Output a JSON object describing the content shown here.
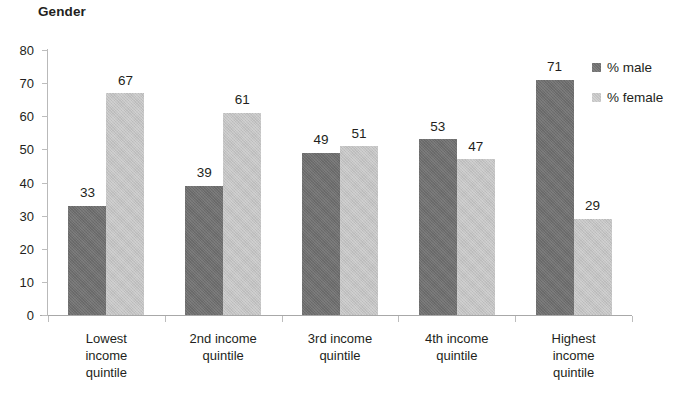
{
  "chart_data": {
    "type": "bar",
    "title": "Gender",
    "xlabel": "",
    "ylabel": "",
    "ylim": [
      0,
      80
    ],
    "ytick_step": 10,
    "yticks": [
      "0",
      "10",
      "20",
      "30",
      "40",
      "50",
      "60",
      "70",
      "80"
    ],
    "grid": false,
    "legend_position": "right",
    "categories": [
      "Lowest income quintile",
      "2nd income quintile",
      "3rd income quintile",
      "4th income quintile",
      "Highest income quintile"
    ],
    "category_lines": [
      [
        "Lowest",
        "income",
        "quintile"
      ],
      [
        "2nd income",
        "quintile"
      ],
      [
        "3rd income",
        "quintile"
      ],
      [
        "4th income",
        "quintile"
      ],
      [
        "Highest",
        "income",
        "quintile"
      ]
    ],
    "series": [
      {
        "name": "% male",
        "color": "#6e6e6e",
        "values": [
          33,
          39,
          49,
          53,
          71
        ]
      },
      {
        "name": "% female",
        "color": "#c3c3c3",
        "values": [
          67,
          61,
          51,
          47,
          29
        ]
      }
    ]
  },
  "legend": {
    "items": [
      {
        "label": "% male",
        "color": "#6e6e6e"
      },
      {
        "label": "% female",
        "color": "#c3c3c3"
      }
    ]
  },
  "colors": {
    "male": "#6e6e6e",
    "female": "#c3c3c3",
    "text": "#231f20",
    "axis": "#b9b9b9",
    "background": "#ffffff"
  }
}
